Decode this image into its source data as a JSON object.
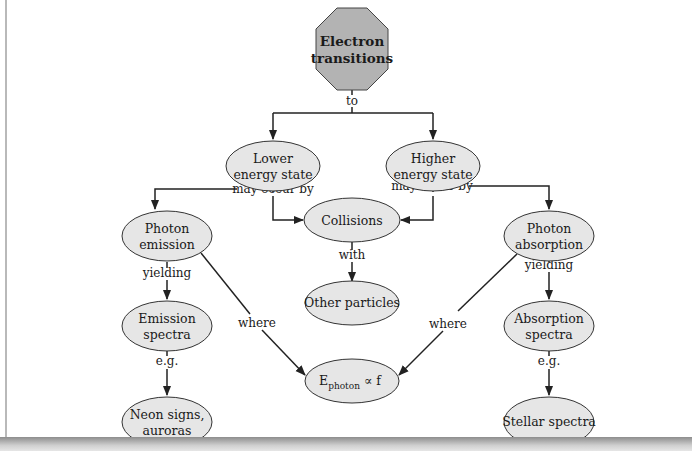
{
  "diagram": {
    "type": "concept-map",
    "root": {
      "id": "electron-transitions",
      "lines": [
        "Electron",
        "transitions"
      ],
      "shape": "octagon"
    },
    "nodes": [
      {
        "id": "lower-energy-state",
        "lines": [
          "Lower",
          "energy state"
        ]
      },
      {
        "id": "higher-energy-state",
        "lines": [
          "Higher",
          "energy state"
        ]
      },
      {
        "id": "photon-emission",
        "lines": [
          "Photon",
          "emission"
        ]
      },
      {
        "id": "collisions",
        "lines": [
          "Collisions"
        ]
      },
      {
        "id": "photon-absorption",
        "lines": [
          "Photon",
          "absorption"
        ]
      },
      {
        "id": "other-particles",
        "lines": [
          "Other particles"
        ]
      },
      {
        "id": "emission-spectra",
        "lines": [
          "Emission",
          "spectra"
        ]
      },
      {
        "id": "absorption-spectra",
        "lines": [
          "Absorption",
          "spectra"
        ]
      },
      {
        "id": "e-photon",
        "main": "E",
        "sub": "photon",
        "tail": " ∝ f"
      },
      {
        "id": "neon-signs",
        "lines": [
          "Neon signs,",
          "auroras"
        ]
      },
      {
        "id": "stellar-spectra",
        "lines": [
          "Stellar spectra"
        ]
      }
    ],
    "edge_labels": {
      "to": "to",
      "may_occur_by_left": "may occur by",
      "may_occur_by_right": "may occur by",
      "with": "with",
      "yielding_left": "yielding",
      "yielding_right": "yielding",
      "where_left": "where",
      "where_right": "where",
      "eg_left": "e.g.",
      "eg_right": "e.g."
    },
    "edges": [
      {
        "from": "electron-transitions",
        "to": "lower-energy-state",
        "label": "to"
      },
      {
        "from": "electron-transitions",
        "to": "higher-energy-state",
        "label": "to"
      },
      {
        "from": "lower-energy-state",
        "to": "photon-emission",
        "label": "may occur by"
      },
      {
        "from": "lower-energy-state",
        "to": "collisions",
        "label": "may occur by"
      },
      {
        "from": "higher-energy-state",
        "to": "collisions",
        "label": "may occur by"
      },
      {
        "from": "higher-energy-state",
        "to": "photon-absorption",
        "label": "may occur by"
      },
      {
        "from": "collisions",
        "to": "other-particles",
        "label": "with"
      },
      {
        "from": "photon-emission",
        "to": "emission-spectra",
        "label": "yielding"
      },
      {
        "from": "photon-absorption",
        "to": "absorption-spectra",
        "label": "yielding"
      },
      {
        "from": "photon-emission",
        "to": "e-photon",
        "label": "where"
      },
      {
        "from": "photon-absorption",
        "to": "e-photon",
        "label": "where"
      },
      {
        "from": "emission-spectra",
        "to": "neon-signs",
        "label": "e.g."
      },
      {
        "from": "absorption-spectra",
        "to": "stellar-spectra",
        "label": "e.g."
      }
    ],
    "colors": {
      "octagon_fill": "#b3b3b3",
      "ellipse_fill": "#e6e6e6",
      "stroke": "#222222",
      "line": "#222222"
    }
  }
}
